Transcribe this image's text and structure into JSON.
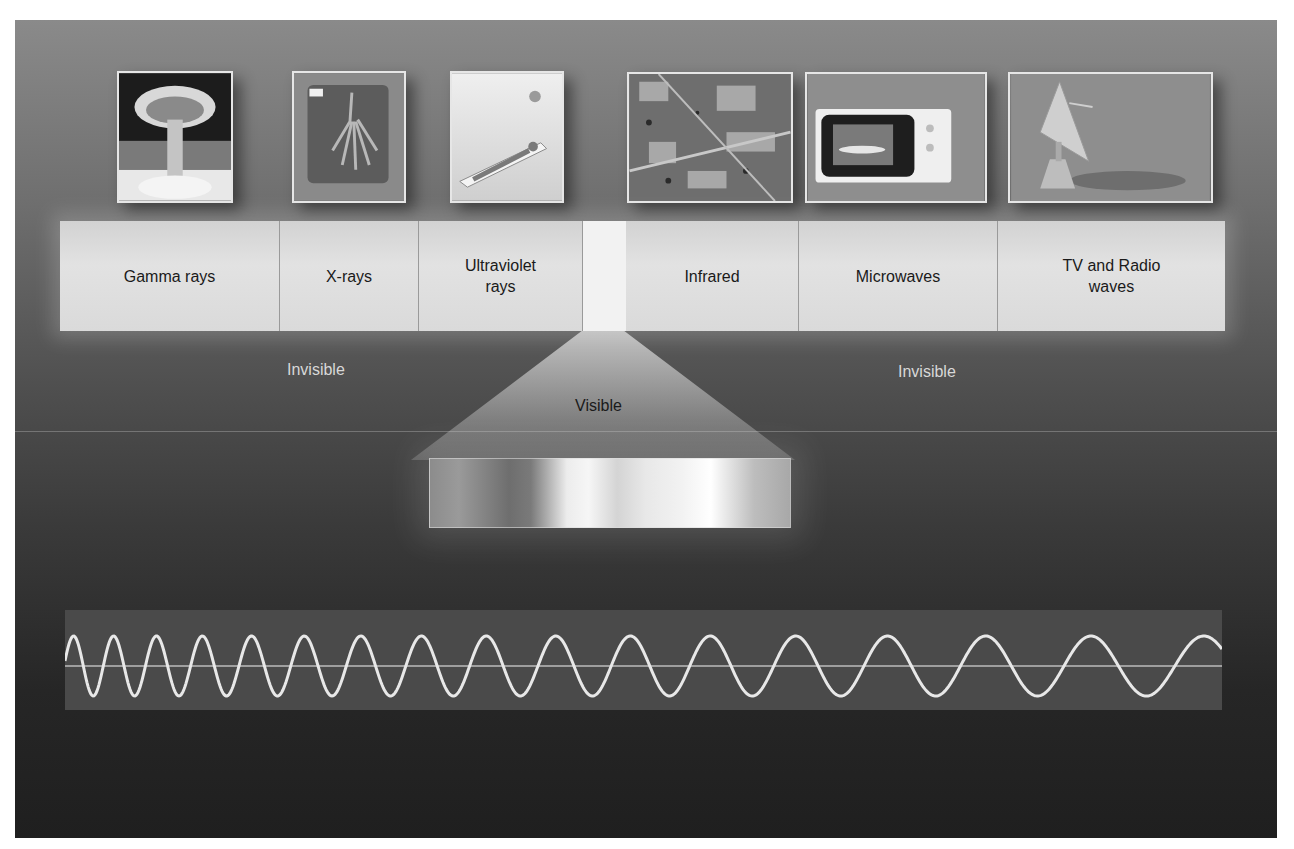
{
  "diagram": {
    "bands": [
      {
        "label": "Gamma rays",
        "picture": "mushroom-cloud"
      },
      {
        "label": "X-rays",
        "picture": "hand-x-ray"
      },
      {
        "label": "Ultraviolet rays",
        "label_line1": "Ultraviolet",
        "label_line2": "rays",
        "picture": "sunbather"
      },
      {
        "label": "",
        "picture": ""
      },
      {
        "label": "Infrared",
        "picture": "satellite-infrared-map"
      },
      {
        "label": "Microwaves",
        "picture": "microwave-oven"
      },
      {
        "label": "TV and Radio waves",
        "label_line1": "TV and Radio",
        "label_line2": "waves",
        "picture": "satellite-dish"
      }
    ],
    "invisible_left": "Invisible",
    "invisible_right": "Invisible",
    "visible_label": "Visible",
    "wave": {
      "description": "wave with decreasing frequency from left to right",
      "cycles_approx": 17
    },
    "colors": {
      "band_fill": "#dcdcdc",
      "label_text": "#1a1a1a",
      "invisible_text": "#d8d8d8",
      "wave_stroke": "#e8e8e8",
      "wave_bg": "#4a4a4a"
    }
  }
}
